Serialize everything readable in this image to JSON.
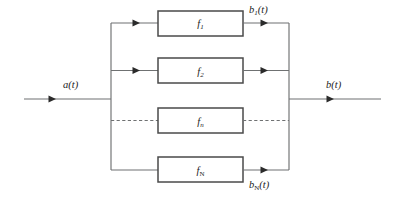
{
  "diagram": {
    "type": "parallel-block-diagram",
    "background_color": "#ffffff",
    "line_color": "#6f7172",
    "box_stroke_color": "#4a4a4a",
    "text_color": "#1b1b1b",
    "input": {
      "label_base": "a",
      "label_arg": "(t)",
      "label_full": "a(t)"
    },
    "output": {
      "label_base": "b",
      "label_arg": "(t)",
      "label_full": "b(t)"
    },
    "branches": [
      {
        "block_label_base": "f",
        "block_label_sub": "1",
        "block_label_full": "f1",
        "output_label_base": "b",
        "output_label_sub": "1",
        "output_label_arg": "(t)",
        "output_label_full": "b1(t)",
        "style": "solid"
      },
      {
        "block_label_base": "f",
        "block_label_sub": "2",
        "block_label_full": "f2",
        "output_label_base": "",
        "output_label_sub": "",
        "output_label_arg": "",
        "output_label_full": "",
        "style": "solid"
      },
      {
        "block_label_base": "f",
        "block_label_sub": "n",
        "block_label_full": "fn",
        "output_label_base": "",
        "output_label_sub": "",
        "output_label_arg": "",
        "output_label_full": "",
        "style": "dashed"
      },
      {
        "block_label_base": "f",
        "block_label_sub": "N",
        "block_label_full": "fN",
        "output_label_base": "b",
        "output_label_sub": "N",
        "output_label_arg": "(t)",
        "output_label_full": "bN(t)",
        "style": "solid"
      }
    ]
  }
}
